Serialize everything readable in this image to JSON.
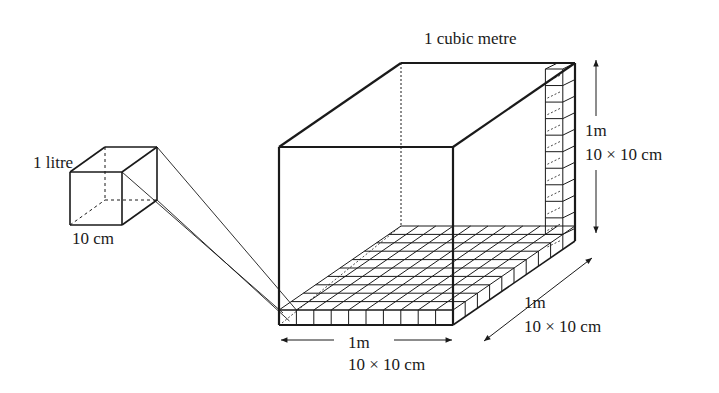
{
  "diagram": {
    "title": "1 cubic metre",
    "litre_cube": {
      "label": "1 litre",
      "edge_label": "10 cm"
    },
    "cubic_metre_box": {
      "label": "1 cubic metre",
      "height": {
        "length": "1m",
        "divisions": "10 × 10 cm"
      },
      "width": {
        "length": "1m",
        "divisions": "10 × 10 cm"
      },
      "depth": {
        "length": "1m",
        "divisions": "10 × 10 cm"
      }
    },
    "colors": {
      "line": "#1a1a1a",
      "background": "#ffffff"
    }
  }
}
